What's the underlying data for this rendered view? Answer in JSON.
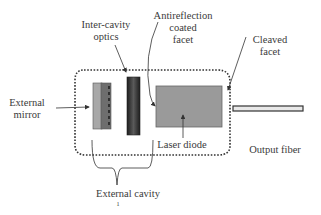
{
  "diagram": {
    "labels": {
      "inter_cavity_optics": [
        "Inter-cavity",
        "optics"
      ],
      "antireflection": [
        "Antireflection",
        "coated",
        "facet"
      ],
      "cleaved_facet": [
        "Cleaved",
        "facet"
      ],
      "external_mirror": [
        "External",
        "mirror"
      ],
      "laser_diode": "Laser diode",
      "output_fiber": "Output fiber",
      "external_cavity": "External cavity",
      "footnote_mark": "1"
    },
    "colors": {
      "text": "#3a3a3a",
      "line": "#333333",
      "laser_diode_fill": "#9a9a9a",
      "mirror_light": "#a8a8a8",
      "mirror_dark": "#6e6e6e",
      "optics_dark": "#2e2e2e",
      "fiber_fill": "#e8e8e8"
    }
  }
}
